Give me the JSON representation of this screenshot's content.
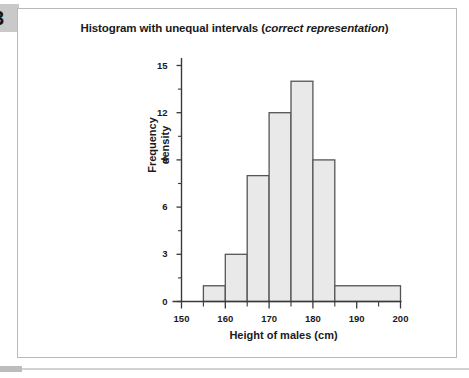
{
  "page": {
    "marker_label": "3"
  },
  "chart_data": {
    "type": "bar",
    "title_main": "Histogram with unequal intervals (",
    "title_italic": "correct representation",
    "title_close": ")",
    "title": "Histogram with unequal intervals (correct representation)",
    "xlabel": "Height of males (cm)",
    "ylabel_line1": "Frequency",
    "ylabel_line2": "density",
    "ylabel": "Frequency density",
    "xlim": [
      150,
      200
    ],
    "ylim": [
      0,
      15.8
    ],
    "grid": false,
    "legend": null,
    "x_major_ticks": [
      150,
      160,
      170,
      180,
      190,
      200
    ],
    "x_minor_ticks": [
      155,
      165,
      175,
      185,
      195
    ],
    "x_tick_labels": [
      "150",
      "160",
      "170",
      "180",
      "190",
      "200"
    ],
    "y_major_ticks": [
      0,
      3,
      6,
      9,
      12,
      15
    ],
    "y_minor_ticks": [
      1.5,
      4.5,
      7.5,
      10.5,
      13.5
    ],
    "y_tick_labels": [
      "0",
      "3",
      "6",
      "9",
      "12",
      "15"
    ],
    "bars": [
      {
        "x_start": 155,
        "x_end": 160,
        "value": 1
      },
      {
        "x_start": 160,
        "x_end": 165,
        "value": 3
      },
      {
        "x_start": 165,
        "x_end": 170,
        "value": 8
      },
      {
        "x_start": 170,
        "x_end": 175,
        "value": 12
      },
      {
        "x_start": 175,
        "x_end": 180,
        "value": 14
      },
      {
        "x_start": 180,
        "x_end": 185,
        "value": 9
      },
      {
        "x_start": 185,
        "x_end": 200,
        "value": 1
      }
    ],
    "categories": [
      "155-160",
      "160-165",
      "165-170",
      "170-175",
      "175-180",
      "180-185",
      "185-200"
    ],
    "values": [
      1,
      3,
      8,
      12,
      14,
      9,
      1
    ],
    "colors": {
      "bar_fill": "#e9e9e9",
      "bar_stroke": "#555555",
      "axis": "#3a3a3a",
      "text": "#1a1a1a",
      "frame": "#b9b9b9"
    }
  }
}
